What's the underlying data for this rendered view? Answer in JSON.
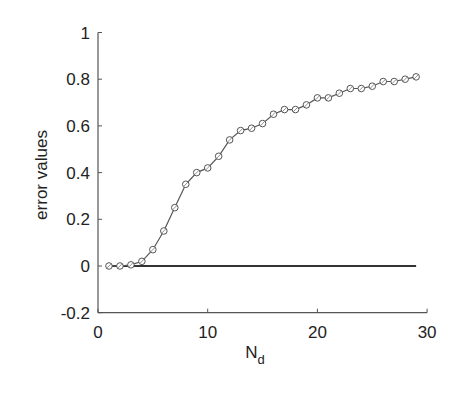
{
  "chart_data": {
    "type": "line",
    "title": "",
    "xlabel": "N_d",
    "xlabel_main": "N",
    "xlabel_sub": "d",
    "ylabel": "error values",
    "xlim": [
      0,
      30
    ],
    "ylim": [
      -0.2,
      1
    ],
    "xticks": [
      "0",
      "10",
      "20",
      "30"
    ],
    "yticks": [
      "-0.2",
      "0",
      "0.2",
      "0.4",
      "0.6",
      "0.8",
      "1"
    ],
    "grid": false,
    "legend": null,
    "series": [
      {
        "name": "error",
        "marker": "circle",
        "x": [
          1,
          2,
          3,
          4,
          5,
          6,
          7,
          8,
          9,
          10,
          11,
          12,
          13,
          14,
          15,
          16,
          17,
          18,
          19,
          20,
          21,
          22,
          23,
          24,
          25,
          26,
          27,
          28,
          29
        ],
        "values": [
          0,
          0,
          0.005,
          0.02,
          0.07,
          0.15,
          0.25,
          0.35,
          0.4,
          0.42,
          0.47,
          0.54,
          0.58,
          0.59,
          0.61,
          0.65,
          0.67,
          0.67,
          0.69,
          0.72,
          0.72,
          0.74,
          0.76,
          0.76,
          0.77,
          0.79,
          0.79,
          0.8,
          0.81
        ]
      },
      {
        "name": "zero line",
        "marker": "none",
        "x": [
          1,
          29
        ],
        "values": [
          0,
          0
        ]
      }
    ]
  }
}
